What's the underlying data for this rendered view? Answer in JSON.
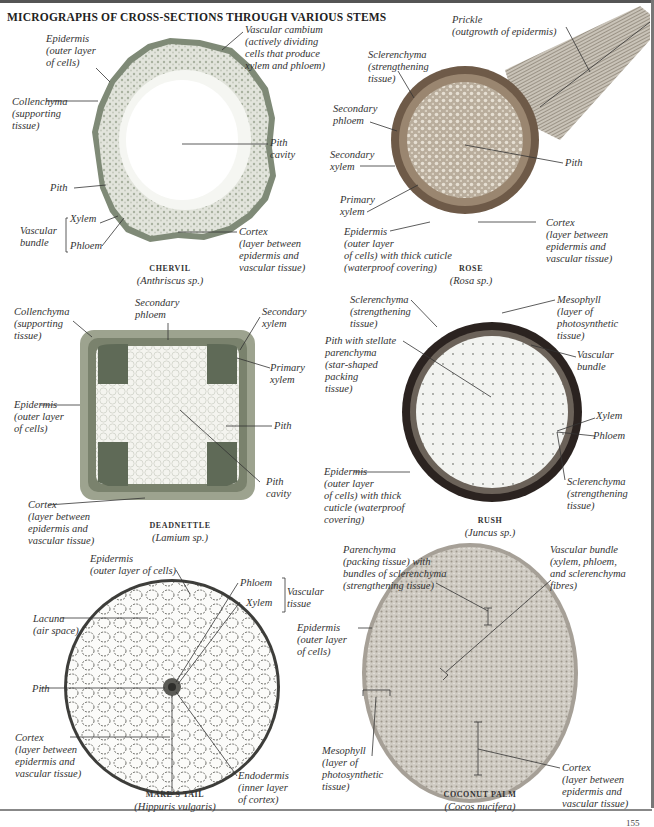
{
  "title": "MICROGRAPHS OF CROSS-SECTIONS THROUGH VARIOUS STEMS",
  "page_number": "155",
  "colors": {
    "ink": "#2a2a2a",
    "tissue_green": "#8a9a7a",
    "rush_dark": "#2b2320",
    "rose_brown": "#7d6650",
    "coconut_grey": "#b5b0a8"
  },
  "panels": {
    "chervil": {
      "name": "CHERVIL",
      "scientific": "(Anthriscus sp.)",
      "labels": {
        "epidermis": "Epidermis\n(outer layer\nof cells)",
        "vascular_cambium": "Vascular cambium\n(actively dividing\ncells that produce\nxylem and phloem)",
        "collenchyma": "Collenchyma\n(supporting\ntissue)",
        "pith_cavity": "Pith\ncavity",
        "pith": "Pith",
        "xylem": "Xylem",
        "phloem": "Phloem",
        "vascular_bundle": "Vascular\nbundle",
        "cortex": "Cortex\n(layer between\nepidermis and\nvascular tissue)"
      }
    },
    "rose": {
      "name": "ROSE",
      "scientific": "(Rosa sp.)",
      "labels": {
        "prickle": "Prickle\n(outgrowth of epidermis)",
        "sclerenchyma": "Sclerenchyma\n(strengthening\ntissue)",
        "secondary_phloem": "Secondary\nphloem",
        "secondary_xylem": "Secondary\nxylem",
        "pith": "Pith",
        "primary_xylem": "Primary\nxylem",
        "epidermis": "Epidermis\n(outer layer\nof cells) with thick cuticle\n(waterproof covering)",
        "cortex": "Cortex\n(layer between\nepidermis and\nvascular tissue)"
      }
    },
    "deadnettle": {
      "name": "DEADNETTLE",
      "scientific": "(Lamium sp.)",
      "labels": {
        "collenchyma": "Collenchyma\n(supporting\ntissue)",
        "secondary_phloem": "Secondary\nphloem",
        "secondary_xylem": "Secondary\nxylem",
        "primary_xylem": "Primary\nxylem",
        "epidermis": "Epidermis\n(outer layer\nof cells)",
        "pith": "Pith",
        "pith_cavity": "Pith\ncavity",
        "cortex": "Cortex\n(layer between\nepidermis and\nvascular tissue)"
      }
    },
    "rush": {
      "name": "RUSH",
      "scientific": "(Juncus sp.)",
      "labels": {
        "sclerenchyma_top": "Sclerenchyma\n(strengthening\ntissue)",
        "mesophyll": "Mesophyll\n(layer of\nphotosynthetic\ntissue)",
        "pith": "Pith with stellate\nparenchyma\n(star-shaped\npacking\ntissue)",
        "vascular_bundle": "Vascular\nbundle",
        "xylem": "Xylem",
        "phloem": "Phloem",
        "epidermis": "Epidermis\n(outer layer\nof cells) with thick\ncuticle (waterproof\ncovering)",
        "sclerenchyma_bottom": "Sclerenchyma\n(strengthening\ntissue)"
      }
    },
    "mares_tail": {
      "name": "MARE'S TAIL",
      "scientific": "(Hippuris vulgaris)",
      "labels": {
        "epidermis": "Epidermis\n(outer layer of cells)",
        "phloem": "Phloem",
        "xylem": "Xylem",
        "vascular_tissue": "Vascular\ntissue",
        "lacuna": "Lacuna\n(air space)",
        "pith": "Pith",
        "cortex": "Cortex\n(layer between\nepidermis and\nvascular tissue)",
        "endodermis": "Endodermis\n(inner layer\nof cortex)"
      }
    },
    "coconut_palm": {
      "name": "COCONUT PALM",
      "scientific": "(Cocos nucifera)",
      "labels": {
        "parenchyma": "Parenchyma\n(packing tissue) with\nbundles of sclerenchyma\n(strengthening tissue)",
        "vascular_bundle": "Vascular bundle\n(xylem, phloem,\nand sclerenchyma\nfibres)",
        "epidermis": "Epidermis\n(outer layer\nof cells)",
        "mesophyll": "Mesophyll\n(layer of\nphotosynthetic\ntissue)",
        "cortex": "Cortex\n(layer between\nepidermis and\nvascular tissue)"
      }
    }
  }
}
